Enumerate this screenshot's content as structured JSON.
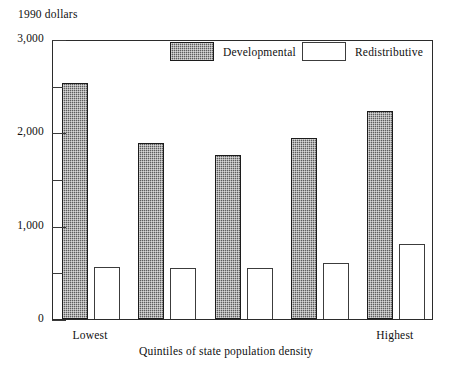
{
  "chart_data": {
    "type": "bar",
    "title": "",
    "subtitle": "",
    "xlabel": "Quintiles of state population density",
    "ylabel": "1990 dollars",
    "ylim": [
      0,
      3000
    ],
    "grid": false,
    "legend_position": "top-inside",
    "categories": [
      "Lowest",
      "2",
      "3",
      "4",
      "Highest"
    ],
    "category_tick_labels": [
      "Lowest",
      "",
      "",
      "",
      "Highest"
    ],
    "y_ticks_major": [
      0,
      1000,
      2000,
      3000
    ],
    "y_tick_labels_major": [
      "0",
      "1,000",
      "2,000",
      "3,000"
    ],
    "y_ticks_minor": [
      500,
      1500,
      2500
    ],
    "series": [
      {
        "name": "Developmental",
        "fill": "hatched-dark",
        "color": "#5d5d5d",
        "values": [
          2530,
          1890,
          1760,
          1940,
          2230
        ]
      },
      {
        "name": "Redistributive",
        "fill": "white",
        "color": "#ffffff",
        "values": [
          560,
          545,
          545,
          595,
          800
        ]
      }
    ]
  },
  "axes": {
    "y_unit_label": "1990 dollars",
    "x_caption": "Quintiles of state population density"
  },
  "legend": {
    "items": [
      {
        "label": "Developmental"
      },
      {
        "label": "Redistributive"
      }
    ]
  }
}
